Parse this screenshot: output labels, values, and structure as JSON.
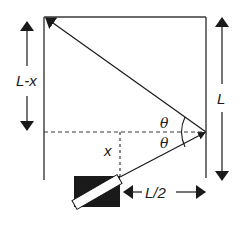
{
  "diagram": {
    "type": "geometry-optics",
    "labels": {
      "left_dim": "L-x",
      "right_dim": "L",
      "bottom_dim": "L/2",
      "height": "x",
      "angle_top": "θ",
      "angle_bottom": "θ"
    },
    "colors": {
      "line": "#3a3a3a",
      "arrow": "#1a1a1a",
      "laser_body": "#1a1a1a",
      "laser_stripe": "#ffffff"
    },
    "geometry": {
      "box": {
        "left": 44,
        "top": 17,
        "right": 206,
        "bottom": 180
      },
      "reflection_point": {
        "x": 206,
        "y": 132
      },
      "source_point": {
        "x": 120,
        "y": 178
      },
      "target_corner": {
        "x": 44,
        "y": 17
      }
    }
  }
}
